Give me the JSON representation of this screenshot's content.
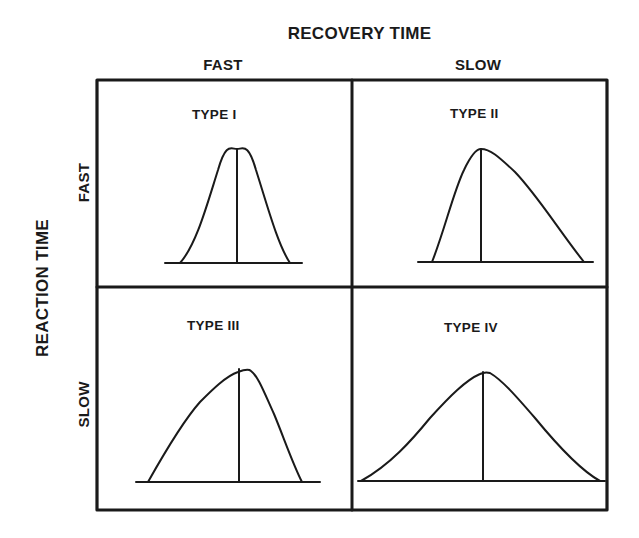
{
  "diagram": {
    "column_axis": {
      "title": "RECOVERY TIME",
      "columns": [
        "FAST",
        "SLOW"
      ]
    },
    "row_axis": {
      "title": "REACTION TIME",
      "rows": [
        "FAST",
        "SLOW"
      ]
    },
    "cells": [
      {
        "label": "TYPE I",
        "reaction": "FAST",
        "recovery": "FAST",
        "shape": "narrow symmetric bell"
      },
      {
        "label": "TYPE II",
        "reaction": "FAST",
        "recovery": "SLOW",
        "shape": "right-skewed (long slow tail)"
      },
      {
        "label": "TYPE III",
        "reaction": "SLOW",
        "recovery": "FAST",
        "shape": "left-skewed (slow rise, fast fall)"
      },
      {
        "label": "TYPE IV",
        "reaction": "SLOW",
        "recovery": "SLOW",
        "shape": "wide flat bell"
      }
    ],
    "colors": {
      "ink": "#1a1a1a",
      "background": "#ffffff"
    }
  }
}
